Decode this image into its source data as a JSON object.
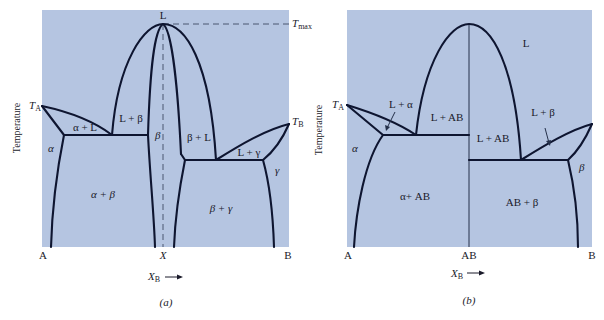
{
  "figure": {
    "panel_fill": "#b5c5e1",
    "line_color": "#0e1530",
    "panels": [
      {
        "id": "a",
        "caption": "(a)",
        "y_axis_label": "Temperature",
        "x_axis_label": "X",
        "x_axis_label_sub": "B",
        "x_axis_arrow": "→",
        "x_ticks": [
          "A",
          "X",
          "B"
        ],
        "temp_labels": {
          "ta": "T",
          "ta_sub": "A",
          "tb": "T",
          "tb_sub": "B",
          "tmax": "T",
          "tmax_sub": "max"
        },
        "regions": {
          "liquid": "L",
          "alpha_plus_l": "α + L",
          "l_plus_beta": "L + β",
          "beta_plus_l": "β + L",
          "l_plus_gamma": "L + γ",
          "alpha": "α",
          "beta": "β",
          "gamma": "γ",
          "alpha_plus_beta": "α + β",
          "beta_plus_gamma": "β + γ"
        }
      },
      {
        "id": "b",
        "caption": "(b)",
        "y_axis_label": "Temperature",
        "x_axis_label": "X",
        "x_axis_label_sub": "B",
        "x_axis_arrow": "→",
        "x_ticks": [
          "A",
          "AB",
          "B"
        ],
        "temp_labels": {
          "ta": "T",
          "ta_sub": "A"
        },
        "regions": {
          "liquid": "L",
          "l_plus_alpha": "L + α",
          "l_plus_ab_left": "L + AB",
          "l_plus_ab_right": "L + AB",
          "l_plus_beta": "L + β",
          "alpha": "α",
          "beta": "β",
          "alpha_plus_ab": "α+ AB",
          "ab_plus_beta": "AB + β"
        }
      }
    ]
  }
}
